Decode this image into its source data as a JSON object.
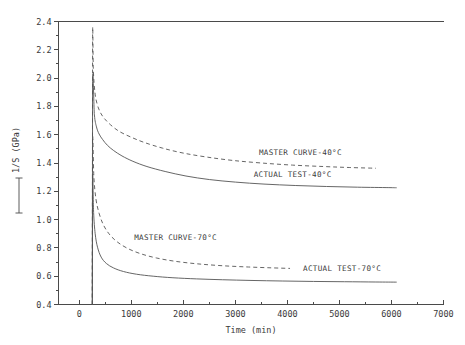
{
  "chart_data": {
    "type": "line",
    "title": "",
    "xlabel": "Time (min)",
    "ylabel": "1/S (GPa)",
    "ylabel_prefix": "[—]",
    "xlim": [
      -400,
      7000
    ],
    "ylim": [
      0.4,
      2.4
    ],
    "xticks": [
      0,
      1000,
      2000,
      3000,
      4000,
      5000,
      6000,
      7000
    ],
    "xticklabels": [
      "0",
      "1000",
      "2000",
      "3000",
      "4000",
      "5000",
      "6000",
      "7000"
    ],
    "yticks": [
      0.4,
      0.6,
      0.8,
      1.0,
      1.2,
      1.4,
      1.6,
      1.8,
      2.0,
      2.2,
      2.4
    ],
    "yticklabels": [
      "0.4",
      "0.6",
      "0.8",
      "1.0",
      "1.2",
      "1.4",
      "1.6",
      "1.8",
      "2.0",
      "2.2",
      "2.4"
    ],
    "grid": false,
    "legend_position": "inline-annotations",
    "series": [
      {
        "name": "MASTER CURVE-40°C",
        "style": "dashed",
        "color": "#555555",
        "x": [
          250,
          255,
          270,
          300,
          340,
          400,
          480,
          600,
          760,
          980,
          1250,
          1600,
          2000,
          2450,
          2950,
          3500,
          4100,
          4700,
          5200,
          5700
        ],
        "y": [
          0.4,
          2.27,
          2.05,
          1.9,
          1.82,
          1.76,
          1.715,
          1.67,
          1.625,
          1.585,
          1.545,
          1.505,
          1.47,
          1.442,
          1.418,
          1.4,
          1.385,
          1.375,
          1.368,
          1.363
        ]
      },
      {
        "name": "ACTUAL TEST-40°C",
        "style": "solid",
        "color": "#555555",
        "x": [
          250,
          255,
          290,
          330,
          380,
          450,
          540,
          660,
          820,
          1030,
          1300,
          1650,
          2050,
          2500,
          3000,
          3550,
          4150,
          4750,
          5350,
          5950,
          6100
        ],
        "y": [
          0.4,
          1.96,
          1.74,
          1.655,
          1.605,
          1.565,
          1.525,
          1.488,
          1.45,
          1.412,
          1.375,
          1.34,
          1.308,
          1.283,
          1.265,
          1.251,
          1.241,
          1.234,
          1.229,
          1.226,
          1.225
        ]
      },
      {
        "name": "MASTER CURVE-70°C",
        "style": "dashed",
        "color": "#555555",
        "x": [
          250,
          255,
          280,
          320,
          380,
          460,
          570,
          720,
          920,
          1170,
          1480,
          1850,
          2280,
          2750,
          3250,
          3700,
          4050
        ],
        "y": [
          0.4,
          1.55,
          1.3,
          1.145,
          1.045,
          0.965,
          0.9,
          0.845,
          0.798,
          0.76,
          0.729,
          0.705,
          0.687,
          0.674,
          0.665,
          0.659,
          0.655
        ]
      },
      {
        "name": "ACTUAL TEST-70°C",
        "style": "solid",
        "color": "#555555",
        "x": [
          250,
          255,
          275,
          305,
          350,
          420,
          520,
          660,
          850,
          1100,
          1420,
          1800,
          2250,
          2750,
          3300,
          3900,
          4500,
          5100,
          5700,
          6100
        ],
        "y": [
          0.4,
          1.3,
          1.05,
          0.9,
          0.805,
          0.735,
          0.69,
          0.658,
          0.633,
          0.614,
          0.6,
          0.589,
          0.581,
          0.575,
          0.57,
          0.566,
          0.563,
          0.561,
          0.559,
          0.558
        ]
      }
    ],
    "annotations": [
      {
        "text": "MASTER CURVE-40°C",
        "x": 4250,
        "y": 1.455
      },
      {
        "text": "ACTUAL TEST-40°C",
        "x": 4100,
        "y": 1.3
      },
      {
        "text": "MASTER CURVE-70°C",
        "x": 1850,
        "y": 0.855
      },
      {
        "text": "ACTUAL TEST-70°C",
        "x": 5050,
        "y": 0.64
      }
    ]
  }
}
